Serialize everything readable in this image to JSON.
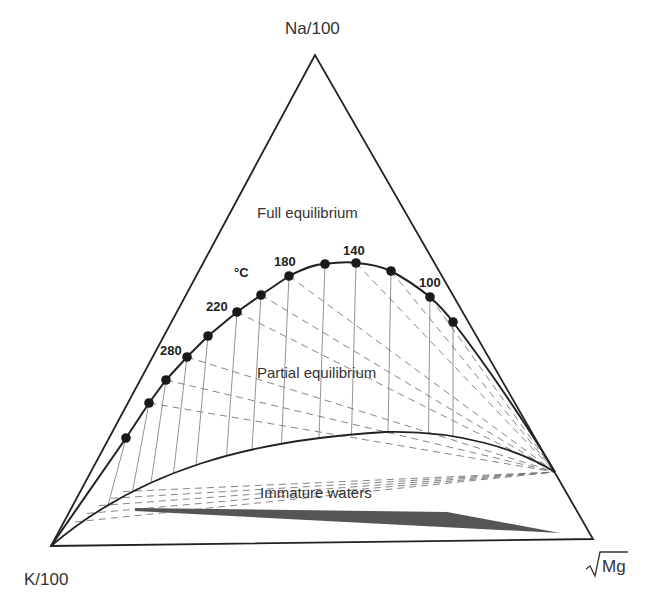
{
  "chart_data": {
    "type": "ternary",
    "title": "",
    "vertices": {
      "top": "Na/100",
      "left": "K/100",
      "right": "√Mg"
    },
    "regions": [
      {
        "label": "Full equilibrium"
      },
      {
        "label": "Partial equilibrium"
      },
      {
        "label": "Immature waters"
      }
    ],
    "temperature_unit": "°C",
    "temperature_labels": [
      "280",
      "220",
      "180",
      "140",
      "100"
    ],
    "full_equilibrium_points": [
      {
        "x": 126,
        "y": 438
      },
      {
        "x": 149,
        "y": 403
      },
      {
        "x": 166,
        "y": 380
      },
      {
        "x": 187,
        "y": 357
      },
      {
        "x": 208,
        "y": 336
      },
      {
        "x": 237,
        "y": 312
      },
      {
        "x": 261,
        "y": 295
      },
      {
        "x": 289,
        "y": 276
      },
      {
        "x": 325,
        "y": 264
      },
      {
        "x": 356,
        "y": 263
      },
      {
        "x": 391,
        "y": 271
      },
      {
        "x": 430,
        "y": 297
      },
      {
        "x": 453,
        "y": 322
      }
    ],
    "grid": {
      "solid_isotherms": true,
      "dashed_lines": true
    }
  },
  "labels": {
    "top_vertex": "Na/100",
    "left_vertex": "K/100",
    "right_vertex_sqrt": "Mg",
    "full_equilibrium": "Full equilibrium",
    "partial_equilibrium": "Partial equilibrium",
    "immature_waters": "Immature waters",
    "unit": "°C",
    "t280": "280",
    "t220": "220",
    "t180": "180",
    "t140": "140",
    "t100": "100"
  },
  "colors": {
    "line": "#222222",
    "grid": "#777777",
    "wedge": "#555555"
  }
}
